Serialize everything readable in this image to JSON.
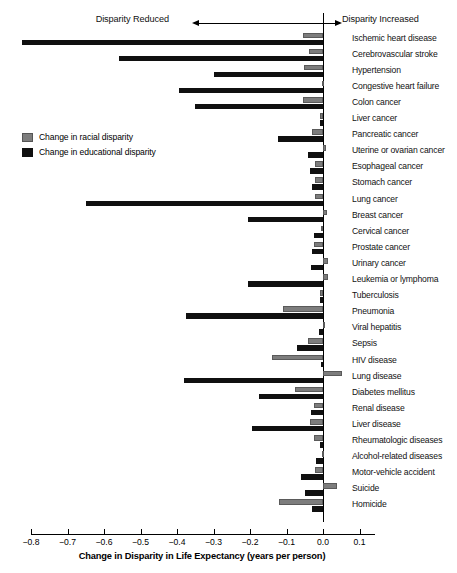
{
  "header": {
    "left_label": "Disparity Reduced",
    "right_label": "Disparity Increased",
    "left_arrow_icon": "arrow-left-icon",
    "right_arrow_icon": "arrow-right-icon"
  },
  "legend": {
    "position": "inside-left",
    "items": [
      {
        "label": "Change in racial disparity",
        "color": "#7d7d7d",
        "key": "racial"
      },
      {
        "label": "Change in educational disparity",
        "color": "#101010",
        "key": "educational"
      }
    ]
  },
  "axis": {
    "title": "Change in Disparity in Life Expectancy (years per person)",
    "ticks": [
      "−0.8",
      "−0.7",
      "−0.6",
      "−0.5",
      "−0.4",
      "−0.3",
      "−0.2",
      "−0.1",
      "0.0",
      "0.1"
    ],
    "tick_values": [
      -0.8,
      -0.7,
      -0.6,
      -0.5,
      -0.4,
      -0.3,
      -0.2,
      -0.1,
      0.0,
      0.1
    ]
  },
  "chart_data": {
    "type": "bar",
    "orientation": "horizontal",
    "title": "",
    "subtitle": "",
    "xlabel": "Change in Disparity in Life Expectancy (years per person)",
    "ylabel": "",
    "xlim": [
      -0.83,
      0.14
    ],
    "grid": false,
    "legend_position": "inside-left",
    "annotations": [
      "Disparity Reduced",
      "Disparity Increased"
    ],
    "zero_reference_line": 0.0,
    "categories": [
      "Ischemic heart disease",
      "Cerebrovascular stroke",
      "Hypertension",
      "Congestive heart failure",
      "Colon cancer",
      "Liver cancer",
      "Pancreatic cancer",
      "Uterine or ovarian cancer",
      "Esophageal cancer",
      "Stomach cancer",
      "Lung cancer",
      "Breast cancer",
      "Cervical cancer",
      "Prostate cancer",
      "Urinary cancer",
      "Leukemia or lymphoma",
      "Tuberculosis",
      "Pneumonia",
      "Viral hepatitis",
      "Sepsis",
      "HIV disease",
      "Lung disease",
      "Diabetes mellitus",
      "Renal disease",
      "Liver disease",
      "Rheumatologic diseases",
      "Alcohol-related diseases",
      "Motor-vehicle accident",
      "Suicide",
      "Homicide"
    ],
    "series": [
      {
        "name": "Change in racial disparity",
        "color": "#7d7d7d",
        "values": [
          -0.055,
          -0.037,
          -0.051,
          -0.004,
          -0.054,
          -0.008,
          -0.029,
          0.009,
          -0.022,
          -0.022,
          -0.022,
          0.011,
          -0.005,
          -0.025,
          0.015,
          0.013,
          -0.007,
          -0.11,
          0.004,
          -0.042,
          -0.14,
          0.051,
          -0.078,
          -0.025,
          -0.036,
          -0.026,
          -0.003,
          -0.022,
          0.038,
          -0.12
        ]
      },
      {
        "name": "Change in educational disparity",
        "color": "#101010",
        "values": [
          -0.825,
          -0.56,
          -0.3,
          -0.395,
          -0.35,
          -0.008,
          -0.123,
          -0.041,
          -0.035,
          -0.03,
          -0.65,
          -0.205,
          -0.026,
          -0.029,
          -0.032,
          -0.205,
          -0.008,
          -0.375,
          -0.011,
          -0.07,
          -0.005,
          -0.38,
          -0.175,
          -0.032,
          -0.195,
          -0.008,
          -0.02,
          -0.06,
          -0.048,
          -0.03
        ]
      }
    ]
  }
}
